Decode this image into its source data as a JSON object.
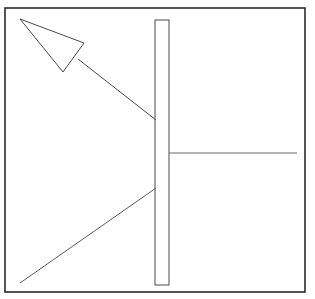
{
  "figure": {
    "background_color": "#ffffff",
    "stroke_color": "#2b2b2b",
    "light_stroke_color": "#6b6b6b",
    "canvas": {
      "width": 315,
      "height": 299
    }
  },
  "shapes": {
    "border": {
      "name": "outer frame rectangle",
      "x": 5,
      "y": 8,
      "width": 300,
      "height": 284,
      "stroke_width": 1.6,
      "stroke_color": "#2b2b2b",
      "fill": "none"
    },
    "triangle": {
      "name": "arrowhead triangle",
      "points": "20,19 84,43 63,72",
      "stroke_width": 1.0,
      "stroke_color": "#4a4a4a",
      "fill": "none"
    },
    "upper_diagonal": {
      "name": "upper diagonal leader line",
      "x1": 78,
      "y1": 59,
      "x2": 156,
      "y2": 120,
      "stroke_width": 1.0,
      "stroke_color": "#4a4a4a"
    },
    "vertical_bar": {
      "name": "tall narrow vertical bar",
      "x": 155,
      "y": 20,
      "width": 14,
      "height": 265,
      "stroke_width": 1.1,
      "stroke_color": "#5a5a5a",
      "fill": "none"
    },
    "horizontal_line": {
      "name": "horizontal line right of bar",
      "x1": 169,
      "y1": 153,
      "x2": 297,
      "y2": 153,
      "stroke_width": 1.1,
      "stroke_color": "#6b6b6b"
    },
    "lower_diagonal": {
      "name": "lower diagonal line",
      "x1": 156,
      "y1": 188,
      "x2": 20,
      "y2": 283,
      "stroke_width": 1.0,
      "stroke_color": "#5a5a5a"
    }
  }
}
